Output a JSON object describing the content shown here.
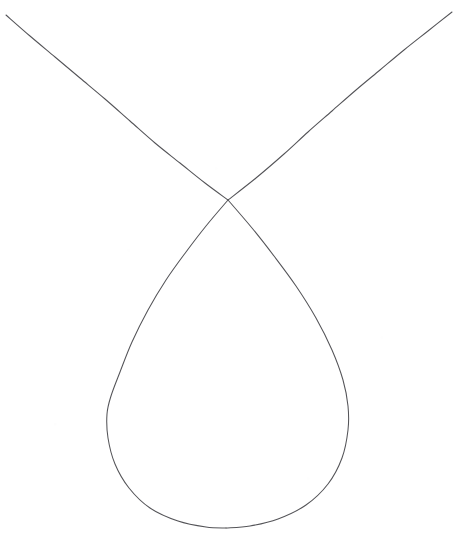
{
  "figure": {
    "title": "Curve with node and loop",
    "background_color": "#ffffff",
    "stroke_color": "#545458",
    "stroke_width": 1.05,
    "width": 460,
    "height": 544,
    "caption": ""
  },
  "chart_data": {
    "type": "line",
    "title": "",
    "subtitle": "",
    "xlabel": "",
    "ylabel": "",
    "grid": false,
    "legend": [],
    "axes_visible": false,
    "tick_labels_x": [],
    "tick_labels_y": [],
    "xlim": [
      0,
      460
    ],
    "ylim": [
      544,
      0
    ],
    "features": {
      "node_point": [
        228,
        200
      ],
      "loop_bottom_point": [
        226,
        528
      ],
      "loop_left_extreme": [
        107,
        412
      ],
      "loop_right_extreme": [
        348,
        415
      ],
      "branch_left_end": [
        6,
        15
      ],
      "branch_right_end": [
        452,
        12
      ]
    },
    "series": [
      {
        "name": "left-branch",
        "points": [
          [
            6,
            15
          ],
          [
            30,
            36
          ],
          [
            55,
            57
          ],
          [
            80,
            78
          ],
          [
            105,
            99
          ],
          [
            130,
            121
          ],
          [
            155,
            143
          ],
          [
            180,
            163
          ],
          [
            205,
            183
          ],
          [
            228,
            200
          ]
        ]
      },
      {
        "name": "right-branch",
        "points": [
          [
            452,
            12
          ],
          [
            428,
            31
          ],
          [
            404,
            50
          ],
          [
            380,
            70
          ],
          [
            356,
            90
          ],
          [
            332,
            111
          ],
          [
            308,
            132
          ],
          [
            284,
            154
          ],
          [
            256,
            178
          ],
          [
            228,
            200
          ]
        ]
      },
      {
        "name": "loop-left-side",
        "points": [
          [
            228,
            200
          ],
          [
            206,
            226
          ],
          [
            186,
            252
          ],
          [
            166,
            280
          ],
          [
            148,
            310
          ],
          [
            132,
            342
          ],
          [
            120,
            372
          ],
          [
            111,
            396
          ],
          [
            107,
            414
          ],
          [
            108,
            438
          ],
          [
            115,
            464
          ],
          [
            129,
            488
          ],
          [
            150,
            508
          ],
          [
            178,
            521
          ],
          [
            206,
            527
          ],
          [
            226,
            528
          ]
        ]
      },
      {
        "name": "loop-right-side",
        "points": [
          [
            228,
            200
          ],
          [
            252,
            228
          ],
          [
            274,
            256
          ],
          [
            296,
            286
          ],
          [
            316,
            318
          ],
          [
            332,
            350
          ],
          [
            343,
            380
          ],
          [
            348,
            406
          ],
          [
            348,
            430
          ],
          [
            342,
            458
          ],
          [
            328,
            484
          ],
          [
            306,
            505
          ],
          [
            278,
            519
          ],
          [
            250,
            526
          ],
          [
            226,
            528
          ]
        ]
      }
    ]
  }
}
